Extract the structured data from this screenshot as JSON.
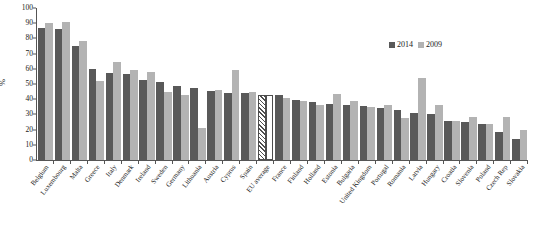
{
  "chart_data": {
    "type": "bar",
    "title": "",
    "xlabel": "",
    "ylabel": "%",
    "ylim": [
      0,
      100
    ],
    "ytick_values": [
      0,
      10,
      20,
      30,
      40,
      50,
      60,
      70,
      80,
      90,
      100
    ],
    "grid": false,
    "legend_position": "top-right",
    "categories": [
      "Belgium",
      "Luxembourg",
      "Malta",
      "Greece",
      "Italy",
      "Denmark",
      "Ireland",
      "Sweden",
      "Germany",
      "Lithuania",
      "Austria",
      "Cyprus",
      "Spain",
      "EU average",
      "France",
      "Finland",
      "Holland",
      "Estonia",
      "Bulgaria",
      "United Kingdom",
      "Portugal",
      "Romania",
      "Latvia",
      "Hungary",
      "Croatia",
      "Slovenia",
      "Poland",
      "Czech Rep",
      "Slovakia"
    ],
    "series": [
      {
        "name": "2014",
        "color": "#595959",
        "values": [
          87,
          86,
          75,
          60,
          57,
          56.5,
          52.5,
          51,
          48.5,
          47.5,
          45.5,
          44,
          44,
          43,
          42.5,
          39.5,
          38,
          37,
          36.5,
          35.5,
          34.5,
          33,
          31,
          30,
          25.5,
          25,
          24,
          18.5,
          13.5
        ]
      },
      {
        "name": "2009",
        "color": "#b3b3b3",
        "values": [
          90,
          90.5,
          78,
          52,
          64.5,
          59,
          58,
          45,
          43,
          21,
          46,
          59,
          44.5,
          43,
          40.5,
          38.5,
          36.5,
          43.5,
          39,
          35,
          36.5,
          27.5,
          54,
          36,
          25.5,
          28,
          24,
          28.5,
          20
        ]
      }
    ],
    "highlight_category": "EU average",
    "highlight_style": "hatched"
  },
  "legend": {
    "entries": [
      {
        "label": "2014",
        "swatch": "dark-gray-swatch"
      },
      {
        "label": "2009",
        "swatch": "light-gray-swatch"
      }
    ]
  }
}
